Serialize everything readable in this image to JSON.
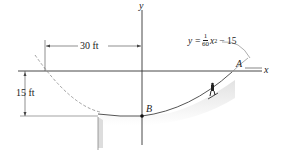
{
  "diagram": {
    "axes": {
      "x_label": "x",
      "y_label": "y"
    },
    "equation": {
      "lhs": "y =",
      "numerator": "1",
      "denominator": "60",
      "var": "x",
      "exponent": "2",
      "rest": "− 15"
    },
    "dimensions": {
      "horizontal": "30 ft",
      "vertical": "15 ft"
    },
    "points": {
      "A": "A",
      "B": "B"
    },
    "colors": {
      "line": "#555555",
      "axis": "#333333",
      "dashed": "#888888",
      "shade": "#d9d9d9"
    }
  }
}
